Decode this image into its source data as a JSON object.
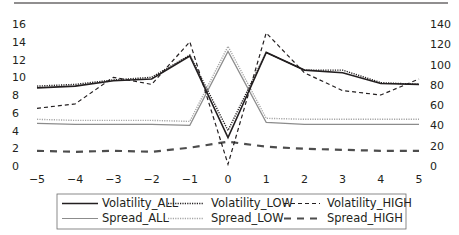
{
  "chart_data": {
    "type": "line",
    "title": "",
    "xlabel": "",
    "ylabel": "",
    "y2label": "",
    "x": [
      -5,
      -4,
      -3,
      -2,
      -1,
      0,
      1,
      2,
      3,
      4,
      5
    ],
    "x_tick_labels": [
      "−5",
      "−4",
      "−3",
      "−2",
      "−1",
      "0",
      "1",
      "2",
      "3",
      "4",
      "5"
    ],
    "xlim": [
      -5,
      5
    ],
    "ylim": [
      0,
      16
    ],
    "y_ticks": [
      0,
      2,
      4,
      6,
      8,
      10,
      12,
      14,
      16
    ],
    "y2lim": [
      0,
      140
    ],
    "y2_ticks": [
      0,
      20,
      40,
      60,
      80,
      100,
      120,
      140
    ],
    "grid": false,
    "legend_position": "bottom",
    "series": [
      {
        "name": "Volatility_ALL",
        "axis": "left",
        "color": "#231f20",
        "style": "solid",
        "width": 1.6,
        "values": [
          8.8,
          9.0,
          9.6,
          9.8,
          12.4,
          3.2,
          12.8,
          10.8,
          10.5,
          9.3,
          9.2
        ]
      },
      {
        "name": "Volatility_LOW",
        "axis": "left",
        "color": "#231f20",
        "style": "dotted",
        "width": 1.4,
        "values": [
          9.0,
          9.2,
          9.7,
          10.0,
          12.5,
          4.0,
          12.8,
          10.8,
          10.8,
          9.4,
          9.2
        ]
      },
      {
        "name": "Volatility_HIGH",
        "axis": "left",
        "color": "#231f20",
        "style": "dashed",
        "width": 1.2,
        "values": [
          6.5,
          7.0,
          10.0,
          9.2,
          14.0,
          0.2,
          15.0,
          10.5,
          8.5,
          8.0,
          9.8
        ]
      },
      {
        "name": "Spread_ALL",
        "axis": "right",
        "color": "#8c8c8c",
        "style": "solid",
        "width": 1.2,
        "values": [
          42,
          41,
          41,
          41,
          40,
          113,
          43,
          41,
          41,
          41,
          41
        ]
      },
      {
        "name": "Spread_LOW",
        "axis": "right",
        "color": "#a6a6a6",
        "style": "dotted",
        "width": 1.4,
        "values": [
          46,
          45,
          45,
          45,
          44,
          118,
          47,
          46,
          46,
          46,
          46
        ]
      },
      {
        "name": "Spread_HIGH",
        "axis": "right",
        "color": "#4d4d4d",
        "style": "longdash",
        "width": 2.2,
        "values": [
          15,
          14,
          15,
          14,
          18,
          24,
          19,
          17,
          16,
          15,
          15
        ]
      }
    ]
  },
  "legend": {
    "items": [
      {
        "label": "Volatility_ALL"
      },
      {
        "label": "Volatility_LOW"
      },
      {
        "label": "Volatility_HIGH"
      },
      {
        "label": "Spread_ALL"
      },
      {
        "label": "Spread_LOW"
      },
      {
        "label": "Spread_HIGH"
      }
    ]
  }
}
